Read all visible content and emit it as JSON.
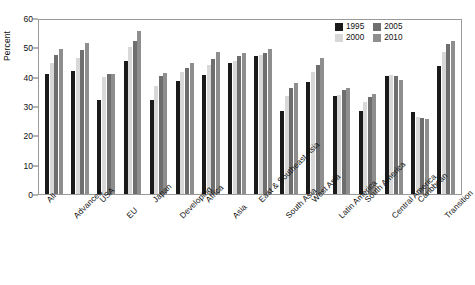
{
  "chart_data": {
    "type": "bar",
    "title": "",
    "xlabel": "",
    "ylabel": "Percent",
    "ylim": [
      0,
      60
    ],
    "yticks": [
      0,
      10,
      20,
      30,
      40,
      50,
      60
    ],
    "grid": false,
    "legend_position": "top-right",
    "categories": [
      "All",
      "Advanced",
      "USA",
      "EU",
      "Japan",
      "Developing",
      "Africa",
      "Asia",
      "East & Southeast Asia",
      "South Asia",
      "West Asia",
      "Latin America",
      "South America",
      "Central America",
      "Caribbean",
      "Transition"
    ],
    "series": [
      {
        "name": "1995",
        "color": "#1a1a1a",
        "values": [
          41.0,
          42.0,
          32.0,
          45.2,
          32.2,
          38.4,
          40.5,
          44.5,
          47.0,
          28.3,
          38.3,
          33.3,
          28.3,
          40.3,
          28.0,
          43.8
        ]
      },
      {
        "name": "2000",
        "color": "#d8d8d8",
        "values": [
          44.8,
          46.2,
          40.0,
          50.0,
          36.7,
          41.5,
          44.0,
          45.5,
          47.3,
          33.5,
          41.5,
          33.7,
          31.5,
          40.7,
          26.2,
          48.5
        ]
      },
      {
        "name": "2005",
        "color": "#6e6e6e",
        "values": [
          47.3,
          49.0,
          41.0,
          52.2,
          40.2,
          43.0,
          46.0,
          47.0,
          48.0,
          36.0,
          44.0,
          35.3,
          33.0,
          40.2,
          26.0,
          51.0
        ]
      },
      {
        "name": "2010",
        "color": "#8e8e8e",
        "values": [
          49.5,
          51.6,
          41.0,
          55.6,
          41.3,
          44.7,
          48.5,
          48.2,
          49.5,
          37.8,
          46.5,
          36.0,
          34.2,
          38.7,
          25.7,
          52.3
        ]
      }
    ]
  }
}
